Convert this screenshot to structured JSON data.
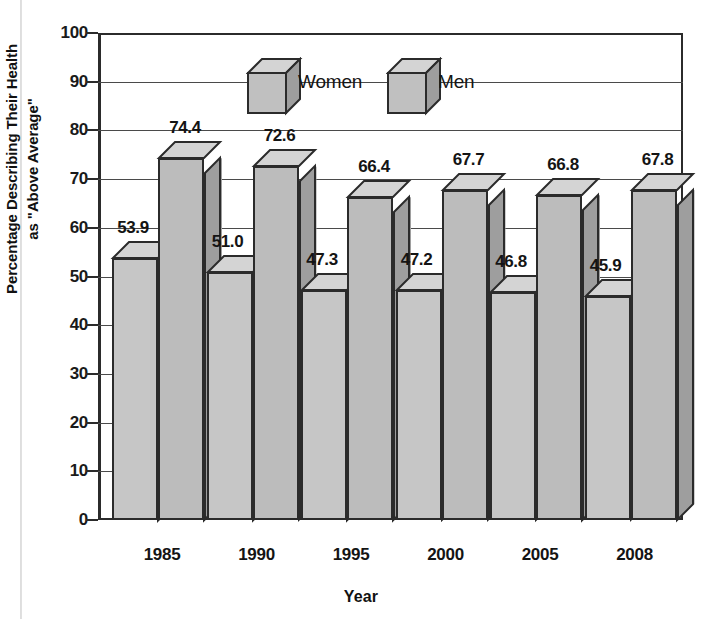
{
  "chart_data": {
    "type": "bar",
    "title": "",
    "xlabel": "Year",
    "ylabel": "Percentage Describing Their Health as \"Above Average\"",
    "ylabel_line1": "Percentage Describing Their Health",
    "ylabel_line2": "as \"Above Average\"",
    "categories": [
      "1985",
      "1990",
      "1995",
      "2000",
      "2005",
      "2008"
    ],
    "series": [
      {
        "name": "Women",
        "values": [
          53.9,
          51.0,
          47.3,
          47.2,
          46.8,
          45.9
        ]
      },
      {
        "name": "Men",
        "values": [
          74.4,
          72.6,
          66.4,
          67.7,
          66.8,
          67.8
        ]
      }
    ],
    "value_labels": {
      "women": [
        "53.9",
        "51.0",
        "47.3",
        "47.2",
        "46.8",
        "45.9"
      ],
      "men": [
        "74.4",
        "72.6",
        "66.4",
        "67.7",
        "66.8",
        "67.8"
      ]
    },
    "ylim": [
      0,
      100
    ],
    "yticks": [
      100,
      90,
      80,
      70,
      60,
      50,
      40,
      30,
      20,
      10,
      0
    ],
    "ytick_labels": [
      "100",
      "90",
      "80",
      "70",
      "60",
      "50",
      "40",
      "30",
      "20",
      "10",
      "0"
    ],
    "grid": true,
    "legend_position": "top-center",
    "style": "3d-column",
    "colors": {
      "bar_front": "#c0c0c0",
      "bar_side": "#9e9e9e",
      "bar_top": "#d4d4d4",
      "outline": "#2b2b2b",
      "gridline": "#4a4a4a",
      "text": "#141414",
      "background": "#ffffff"
    }
  },
  "legend": {
    "items": [
      {
        "label": "Women",
        "icon": "cube-swatch"
      },
      {
        "label": "Men",
        "icon": "cube-swatch"
      }
    ]
  },
  "axes": {
    "x_title": "Year",
    "y_title_line1": "Percentage Describing Their Health",
    "y_title_line2": "as \"Above Average\""
  }
}
